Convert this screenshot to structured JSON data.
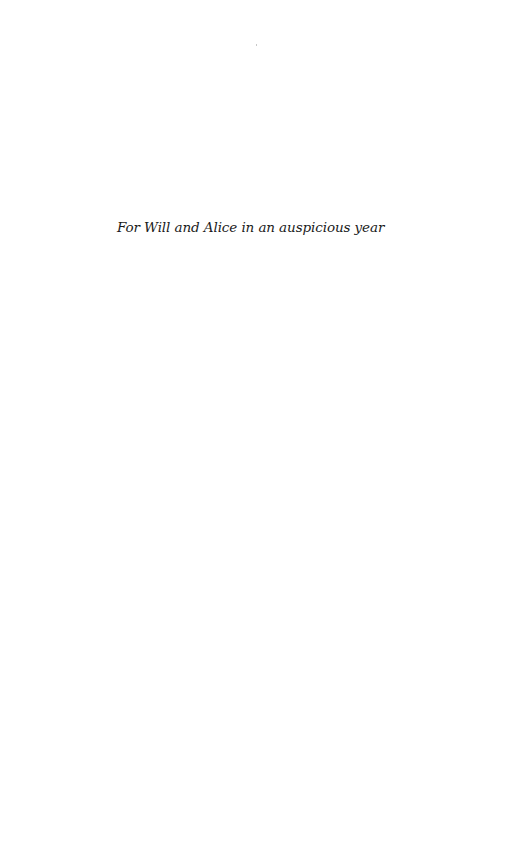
{
  "page": {
    "dedication": "For Will and Alice in an auspicious year"
  }
}
